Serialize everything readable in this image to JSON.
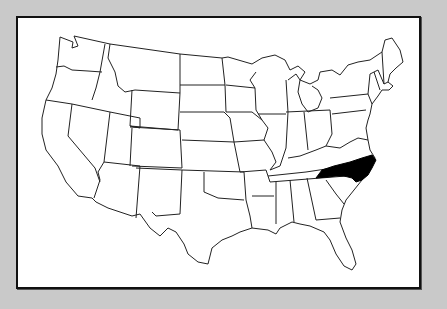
{
  "map": {
    "type": "us-states-outline",
    "highlighted_state": "North Carolina",
    "colors": {
      "background": "#c9c9c9",
      "frame_fill": "#ffffff",
      "frame_border": "#111111",
      "state_fill": "#ffffff",
      "state_stroke": "#222222",
      "highlight_fill": "#000000"
    }
  }
}
